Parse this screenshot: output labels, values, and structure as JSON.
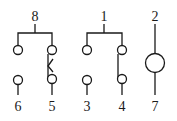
{
  "diagram": {
    "pins": [
      {
        "id": "8",
        "label": "8",
        "role": "common"
      },
      {
        "id": "6",
        "label": "6",
        "role": "contact"
      },
      {
        "id": "5",
        "label": "5",
        "role": "contact"
      },
      {
        "id": "1",
        "label": "1",
        "role": "common"
      },
      {
        "id": "3",
        "label": "3",
        "role": "contact"
      },
      {
        "id": "4",
        "label": "4",
        "role": "contact"
      },
      {
        "id": "2",
        "label": "2",
        "role": "coil"
      },
      {
        "id": "7",
        "label": "7",
        "role": "coil"
      }
    ],
    "groups": [
      {
        "name": "switch-group-left",
        "common": "8",
        "contacts": [
          "6",
          "5"
        ],
        "closed_contact": "5",
        "marker": "triangle"
      },
      {
        "name": "switch-group-middle",
        "common": "1",
        "contacts": [
          "3",
          "4"
        ],
        "closed_contact": "4"
      },
      {
        "name": "coil",
        "terminals": [
          "2",
          "7"
        ],
        "symbol": "circle"
      }
    ],
    "colors": {
      "line": "#1a1a1a",
      "background": "#ffffff"
    }
  }
}
